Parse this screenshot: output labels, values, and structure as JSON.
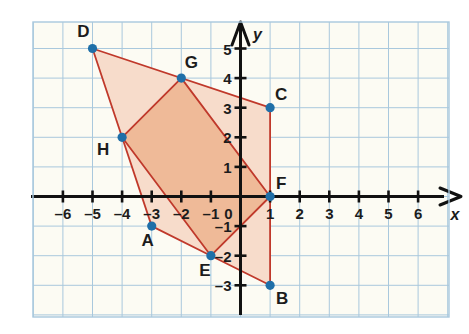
{
  "figure": {
    "axes": {
      "x_label": "x",
      "y_label": "y",
      "origin_label": "0",
      "x_ticks": [
        -6,
        -5,
        -4,
        -3,
        -2,
        -1,
        1,
        2,
        3,
        4,
        5,
        6
      ],
      "y_ticks": [
        5,
        4,
        3,
        2,
        1,
        -1,
        -2,
        -3
      ],
      "x_tick_labels": [
        "–6",
        "–5",
        "–4",
        "–3",
        "–2",
        "–1",
        "1",
        "2",
        "3",
        "4",
        "5",
        "6"
      ],
      "y_tick_labels": [
        "5",
        "4",
        "3",
        "2",
        "1",
        "–1",
        "–2",
        "–3"
      ],
      "xlim": [
        -6.9,
        7.0
      ],
      "ylim": [
        -3.9,
        5.8
      ],
      "grid": true
    },
    "colors": {
      "grid_line": "#a9c8dd",
      "grid_bg": "#fcfbf3",
      "axis": "#111111",
      "polygon_stroke": "#c0392b",
      "fill_outer": "#f7dccb",
      "fill_inner": "#efba98",
      "point": "#1f6fa8",
      "text": "#1c1c1c"
    },
    "points": [
      {
        "name": "A",
        "x": -3,
        "y": -1,
        "label_dx": -4,
        "label_dy": 20
      },
      {
        "name": "B",
        "x": 1,
        "y": -3,
        "label_dx": 12,
        "label_dy": 19
      },
      {
        "name": "C",
        "x": 1,
        "y": 3,
        "label_dx": 11,
        "label_dy": -8
      },
      {
        "name": "D",
        "x": -5,
        "y": 5,
        "label_dx": -9,
        "label_dy": -12
      },
      {
        "name": "E",
        "x": -1,
        "y": -2,
        "label_dx": -6,
        "label_dy": 20
      },
      {
        "name": "F",
        "x": 1,
        "y": 0,
        "label_dx": 11,
        "label_dy": -8
      },
      {
        "name": "G",
        "x": -2,
        "y": 4,
        "label_dx": 10,
        "label_dy": -10
      },
      {
        "name": "H",
        "x": -4,
        "y": 2,
        "label_dx": -19,
        "label_dy": 18
      }
    ],
    "polygons": [
      {
        "name": "outer-quadrilateral",
        "vertices": [
          "D",
          "C",
          "B",
          "E",
          "A",
          "H"
        ],
        "fill": "#f7dccb"
      },
      {
        "name": "inner-quadrilateral",
        "vertices": [
          "G",
          "F",
          "E",
          "H"
        ],
        "fill": "#efba98"
      }
    ]
  }
}
